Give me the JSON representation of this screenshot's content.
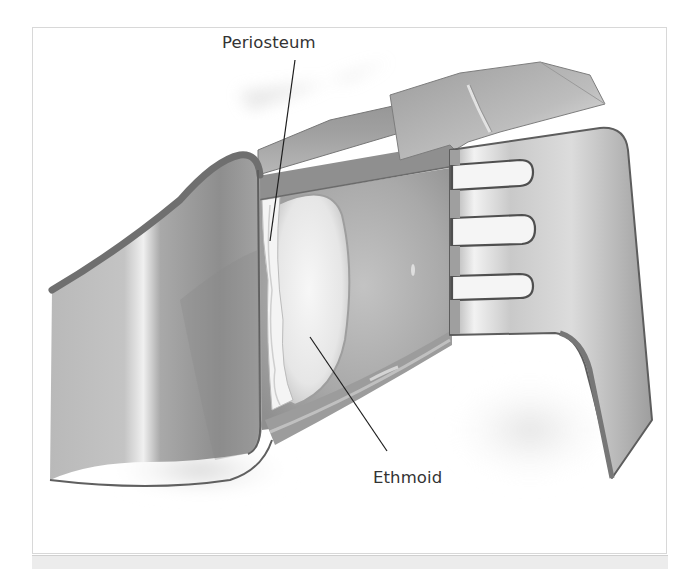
{
  "figure": {
    "type": "surgical-illustration",
    "style": "grayscale",
    "labels": {
      "periosteum": "Periosteum",
      "ethmoid": "Ethmoid"
    },
    "leader_lines": [
      {
        "label": "Periosteum",
        "from": [
          295,
          60
        ],
        "to": [
          270,
          241
        ]
      },
      {
        "label": "Ethmoid",
        "from": [
          387,
          451
        ],
        "to": [
          310,
          337
        ]
      }
    ],
    "colors": {
      "background": "#ffffff",
      "frame_border": "#d8d8d8",
      "caption_strip": "#ececec",
      "instrument_dark": "#6e6e6e",
      "instrument_mid": "#9a9a9a",
      "instrument_light": "#d4d4d4",
      "tissue_mid": "#a8a8a8",
      "bone_light": "#eeeeee",
      "label_text": "#333333"
    }
  }
}
